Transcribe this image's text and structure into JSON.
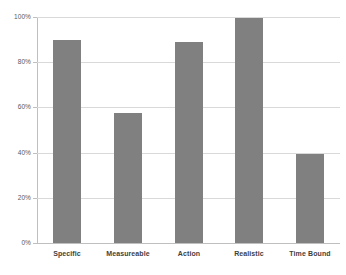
{
  "chart_data": {
    "type": "bar",
    "title": "",
    "subtitle": "",
    "xlabel": "",
    "ylabel": "",
    "categories": [
      "Specific",
      "Measureable",
      "Action",
      "Realistic",
      "Time Bound"
    ],
    "values": [
      90,
      57.5,
      89,
      99.5,
      39.5
    ],
    "value_labels": [
      "90%",
      "57.5%",
      "89%",
      "99.5%",
      "39.5%"
    ],
    "ylim": [
      0,
      100
    ],
    "ytick_labels": [
      "0%",
      "20%",
      "40%",
      "60%",
      "80%",
      "100%"
    ],
    "ytick_values": [
      0,
      20,
      40,
      60,
      80,
      100
    ],
    "grid": true,
    "grid_axis": "y",
    "legend": false,
    "legend_position": "none",
    "series": [
      {
        "name": "",
        "values": [
          90,
          57.5,
          89,
          99.5,
          39.5
        ]
      }
    ],
    "colors": {
      "bar": "#808080",
      "gridline": "#d9d9d9",
      "axis": "#bfbfbf",
      "tick_label": "#595959",
      "category_label": "#3f3f3f",
      "background": "#ffffff"
    }
  }
}
